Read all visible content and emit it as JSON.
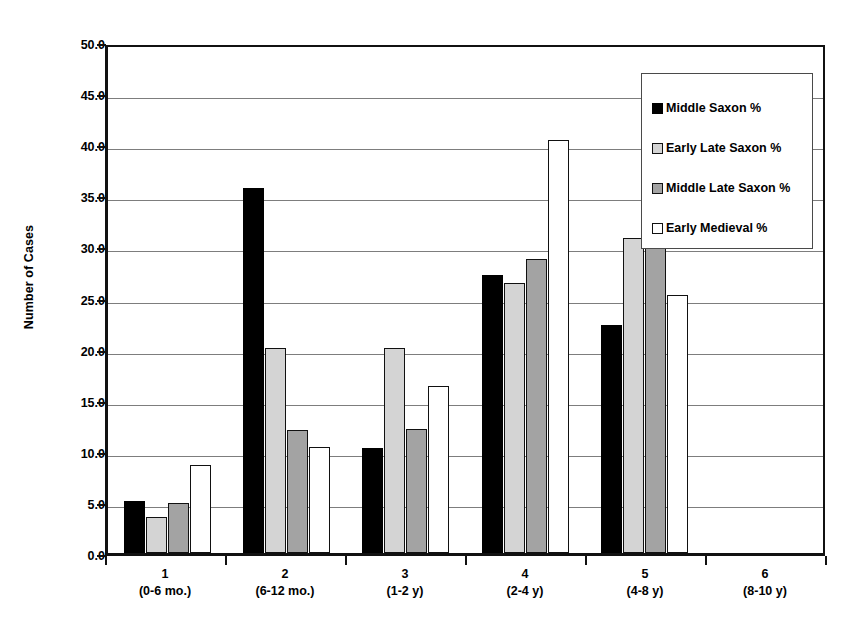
{
  "chart_data": {
    "type": "bar",
    "title": "",
    "xlabel": "",
    "ylabel": "Number of Cases",
    "ylim": [
      0.0,
      50.0
    ],
    "ytick_step": 5.0,
    "grid": true,
    "legend_position": "top-right-inside",
    "categories": [
      "1",
      "2",
      "3",
      "4",
      "5",
      "6"
    ],
    "category_ranges": [
      "(0-6 mo.)",
      "(6-12 mo.)",
      "(1-2 y)",
      "(2-4 y)",
      "(4-8 y)",
      "(8-10 y)"
    ],
    "ytick_labels": [
      "50.0",
      "45.0",
      "40.0",
      "35.0",
      "30.0",
      "25.0",
      "20.0",
      "15.0",
      "10.0",
      "5.0",
      "0.0"
    ],
    "series": [
      {
        "name": "Middle Saxon %",
        "color": "#000000",
        "values": [
          5.1,
          35.7,
          10.3,
          27.2,
          22.3,
          0.0
        ]
      },
      {
        "name": "Early Late Saxon %",
        "color": "#d4d4d4",
        "values": [
          3.5,
          20.1,
          20.1,
          26.4,
          30.8,
          0.0
        ]
      },
      {
        "name": "Middle Late Saxon %",
        "color": "#a3a3a3",
        "values": [
          4.9,
          12.0,
          12.1,
          28.8,
          43.1,
          0.0
        ]
      },
      {
        "name": "Early Medieval %",
        "color": "#ffffff",
        "values": [
          8.6,
          10.4,
          16.3,
          40.4,
          25.2,
          0.0
        ]
      }
    ]
  }
}
